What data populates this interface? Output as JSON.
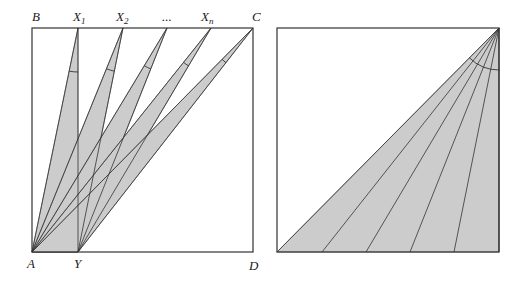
{
  "left_figure": {
    "labels": {
      "B": "B",
      "X1": "X",
      "X1_sub": "1",
      "X2": "X",
      "X2_sub": "2",
      "ellipsis": "...",
      "Xn": "X",
      "Xn_sub": "n",
      "C": "C",
      "A": "A",
      "Y": "Y",
      "D": "D"
    },
    "square": {
      "x": 32,
      "y": 28,
      "size": 221
    },
    "point_A": [
      32,
      252
    ],
    "point_Y": [
      78,
      252
    ],
    "top_points_x": [
      78,
      123,
      167,
      211,
      253
    ],
    "fill_color": "#cccccc",
    "stroke_color": "#333333"
  },
  "right_figure": {
    "square": {
      "x": 277,
      "y": 28,
      "size": 222
    },
    "apex": [
      499,
      28
    ],
    "bottom_points_x": [
      277,
      322,
      366,
      410,
      454,
      499
    ],
    "arc_radius": 42,
    "fill_color": "#cccccc",
    "stroke_color": "#333333"
  }
}
